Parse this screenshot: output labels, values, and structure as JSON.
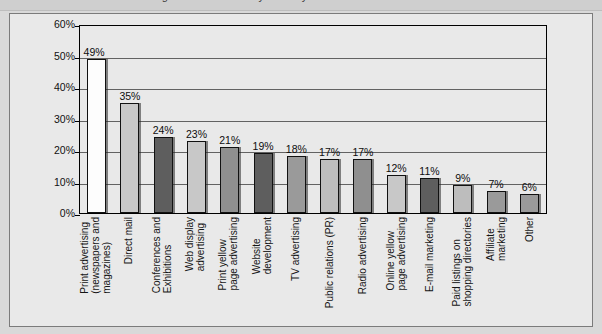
{
  "title_strip": {
    "cut_off_text": "Marketing channels currently used by small and medium businesses"
  },
  "chart_data": {
    "type": "bar",
    "title": "",
    "subtitle": "",
    "xlabel": "",
    "ylabel": "",
    "ylim": [
      0,
      60
    ],
    "yticks": [
      "0%",
      "10%",
      "20%",
      "30%",
      "40%",
      "50%",
      "60%"
    ],
    "ytick_values": [
      0,
      10,
      20,
      30,
      40,
      50,
      60
    ],
    "grid": true,
    "legend": "none",
    "value_suffix": "%",
    "categories": [
      "Print advertising\n(newspapers and\nmagazines)",
      "Direct mail",
      "Conferences and\nExhibitions",
      "Web display\nadvertising",
      "Print yellow\npage advertising",
      "Website\ndevelopment",
      "TV advertising",
      "Public relations (PR)",
      "Radio advertising",
      "Online yellow\npage advertising",
      "E-mail marketing",
      "Paid listings on\nshopping directories",
      "Affiliate\nmarketing",
      "Other"
    ],
    "values": [
      49,
      35,
      24,
      23,
      21,
      19,
      18,
      17,
      17,
      12,
      11,
      9,
      7,
      6
    ],
    "labels": [
      "49%",
      "35%",
      "24%",
      "23%",
      "21%",
      "19%",
      "18%",
      "17%",
      "17%",
      "12%",
      "11%",
      "9%",
      "7%",
      "6%"
    ],
    "bar_colors": [
      "#fdfdfd",
      "#c8c8c8",
      "#5e5e5e",
      "#c8c8c8",
      "#8f8f8f",
      "#5e5e5e",
      "#9a9a9a",
      "#bdbdbd",
      "#8f8f8f",
      "#c8c8c8",
      "#5e5e5e",
      "#bdbdbd",
      "#9a9a9a",
      "#9a9a9a"
    ],
    "colors": {
      "plot_background": "#e9e9e9",
      "frame_background": "#e9e9e9",
      "page_background": "#d9d9d9",
      "axis": "#000000",
      "gridline": "#4a4a4a",
      "text": "#111111"
    }
  }
}
